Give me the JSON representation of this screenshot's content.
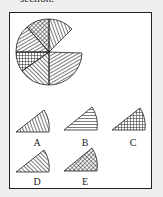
{
  "heading": "section.",
  "figure": {
    "options": [
      {
        "label": "A",
        "pattern": "concentric arcs"
      },
      {
        "label": "B",
        "pattern": "horizontal lines"
      },
      {
        "label": "C",
        "pattern": "cross-hatched grid"
      },
      {
        "label": "D",
        "pattern": "diagonal lines"
      },
      {
        "label": "E",
        "pattern": "diagonal cross-hatch"
      }
    ]
  }
}
